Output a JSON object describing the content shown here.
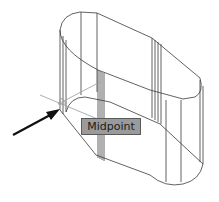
{
  "drawing": {
    "object": "extruded slot solid (wireframe)",
    "line_color": "#3a3a3a",
    "snap_marker_color": "#9a9a9a"
  },
  "tooltip": {
    "label": "Midpoint",
    "background": "#9a9a9a"
  },
  "pointer": {
    "icon": "arrow-icon",
    "color": "#111111"
  }
}
